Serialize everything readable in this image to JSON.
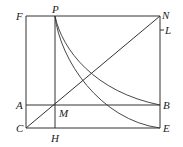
{
  "diagram": {
    "labels": {
      "F": "F",
      "P": "P",
      "N": "N",
      "L": "L",
      "A": "A",
      "M": "M",
      "B": "B",
      "C": "C",
      "H": "H",
      "E": "E"
    },
    "points": {
      "F": [
        26,
        16
      ],
      "P": [
        55,
        16
      ],
      "N": [
        160,
        16
      ],
      "L": [
        160,
        30
      ],
      "A": [
        26,
        105
      ],
      "M": [
        55,
        105
      ],
      "B": [
        160,
        105
      ],
      "C": [
        26,
        128
      ],
      "H": [
        55,
        128
      ],
      "E": [
        160,
        128
      ]
    },
    "segments": [
      [
        "F",
        "N"
      ],
      [
        "F",
        "C"
      ],
      [
        "C",
        "E"
      ],
      [
        "N",
        "E"
      ],
      [
        "P",
        "H"
      ],
      [
        "A",
        "B"
      ],
      [
        "C",
        "N"
      ]
    ],
    "curves": [
      {
        "from": "P",
        "to": "B"
      },
      {
        "from": "P",
        "to": "E"
      }
    ],
    "stroke_color": "#333333"
  }
}
